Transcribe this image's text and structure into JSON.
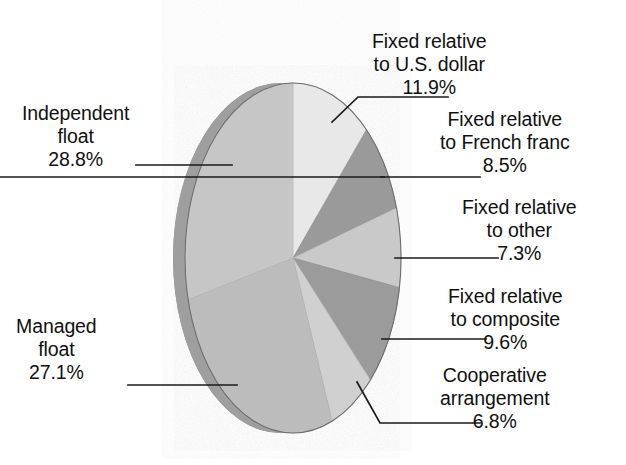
{
  "figure": {
    "title": "",
    "background_color": "#ffffff",
    "width": 626,
    "height": 465
  },
  "chart_data": {
    "type": "pie",
    "title": "",
    "subtitle": "",
    "xlabel": "",
    "ylabel": "",
    "legend_position": "none",
    "grid": false,
    "style": "3d-exploded-none",
    "start_angle_deg": 0,
    "direction": "clockwise",
    "units": "percent",
    "categories": [
      "Fixed relative to U.S. dollar",
      "Fixed relative to French franc",
      "Fixed relative to other",
      "Fixed relative to composite",
      "Cooperative arrangement",
      "Managed float",
      "Independent float"
    ],
    "values": [
      11.9,
      8.5,
      7.3,
      9.6,
      6.8,
      27.1,
      28.8
    ],
    "value_labels": [
      "11.9%",
      "8.5%",
      "7.3%",
      "9.6%",
      "6.8%",
      "27.1%",
      "28.8%"
    ],
    "colors": [
      "#e8e8e8",
      "#9a9a9a",
      "#c9c9c9",
      "#9b9b9b",
      "#d0d0d0",
      "#bcbcbc",
      "#c6c6c6"
    ],
    "slices": [
      {
        "name": "fixed-us-dollar",
        "label_lines": [
          "Fixed relative",
          "to U.S. dollar"
        ],
        "percent_text": "11.9%",
        "value": 11.9,
        "color": "#e8e8e8"
      },
      {
        "name": "fixed-french-franc",
        "label_lines": [
          "Fixed relative",
          "to French franc"
        ],
        "percent_text": "8.5%",
        "value": 8.5,
        "color": "#9a9a9a"
      },
      {
        "name": "fixed-other",
        "label_lines": [
          "Fixed relative",
          "to other"
        ],
        "percent_text": "7.3%",
        "value": 7.3,
        "color": "#c9c9c9"
      },
      {
        "name": "fixed-composite",
        "label_lines": [
          "Fixed relative",
          "to composite"
        ],
        "percent_text": "9.6%",
        "value": 9.6,
        "color": "#9b9b9b"
      },
      {
        "name": "cooperative-arrangement",
        "label_lines": [
          "Cooperative",
          "arrangement"
        ],
        "percent_text": "6.8%",
        "value": 6.8,
        "color": "#d0d0d0"
      },
      {
        "name": "managed-float",
        "label_lines": [
          "Managed",
          "float"
        ],
        "percent_text": "27.1%",
        "value": 27.1,
        "color": "#bcbcbc"
      },
      {
        "name": "independent-float",
        "label_lines": [
          "Independent",
          "float"
        ],
        "percent_text": "28.8%",
        "value": 28.8,
        "color": "#c6c6c6"
      }
    ]
  },
  "labels": {
    "usd": {
      "line1": "Fixed relative",
      "line2": "to U.S. dollar",
      "pct": "11.9%"
    },
    "franc": {
      "line1": "Fixed relative",
      "line2": "to French franc",
      "pct": "8.5%"
    },
    "other": {
      "line1": "Fixed relative",
      "line2": "to other",
      "pct": "7.3%"
    },
    "composite": {
      "line1": "Fixed relative",
      "line2": "to composite",
      "pct": "9.6%"
    },
    "coop": {
      "line1": "Cooperative",
      "line2": "arrangement",
      "pct": "6.8%"
    },
    "indep": {
      "line1": "Independent",
      "line2": "float",
      "pct": "28.8%"
    },
    "managed": {
      "line1": "Managed",
      "line2": "float",
      "pct": "27.1%"
    }
  }
}
